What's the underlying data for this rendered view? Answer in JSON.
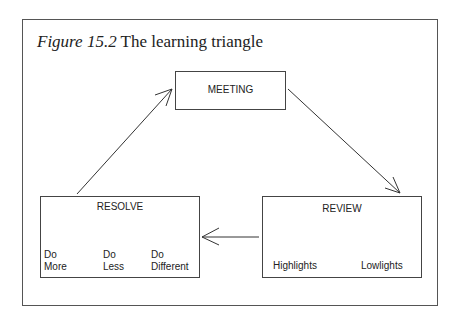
{
  "figure": {
    "number_label": "Figure 15.2",
    "title": "The learning triangle"
  },
  "nodes": {
    "meeting": {
      "label": "MEETING"
    },
    "review": {
      "label": "REVIEW",
      "children": [
        "Highlights",
        "Lowlights"
      ]
    },
    "resolve": {
      "label": "RESOLVE",
      "children": [
        {
          "line1": "Do",
          "line2": "More"
        },
        {
          "line1": "Do",
          "line2": "Less"
        },
        {
          "line1": "Do",
          "line2": "Different"
        }
      ]
    }
  },
  "edges": [
    {
      "from": "MEETING",
      "to": "REVIEW"
    },
    {
      "from": "REVIEW",
      "to": "RESOLVE"
    },
    {
      "from": "RESOLVE",
      "to": "MEETING"
    }
  ]
}
